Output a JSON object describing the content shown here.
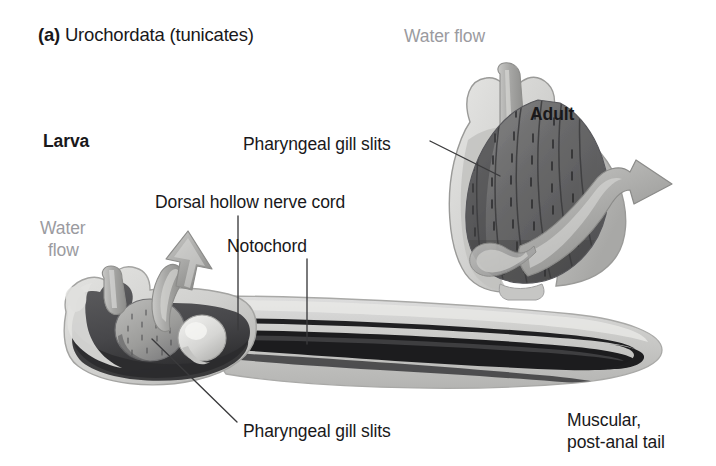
{
  "figure": {
    "panel_letter": "(a)",
    "title_text": " Urochordata (tunicates)",
    "background_color": "#ffffff"
  },
  "labels": {
    "larva": "Larva",
    "adult": "Adult",
    "water_flow_larva_line1": "Water",
    "water_flow_larva_line2": "flow",
    "water_flow_adult": "Water flow",
    "dorsal_hollow_nerve_cord": "Dorsal hollow nerve cord",
    "notochord": "Notochord",
    "pharyngeal_gill_slits_adult": "Pharyngeal gill slits",
    "pharyngeal_gill_slits_larva": "Pharyngeal gill slits",
    "muscular_line1": "Muscular,",
    "muscular_line2": "post-anal tail"
  },
  "colors": {
    "text": "#19181a",
    "text_gray": "#9b9b9f",
    "leader_line": "#3a3a3c",
    "tunic_pale": "#d8d8d6",
    "tunic_mid": "#b5b5b2",
    "tunic_dark": "#8e8e8c",
    "body_dark": "#4d4d4f",
    "body_darkest": "#333335",
    "notochord": "#1f1f21",
    "siphon_gray": "#a9a9a7",
    "gill_basket": "#6e6e70"
  },
  "diagram": {
    "organism": "Urochordata (tunicate)",
    "stages": [
      "Larva",
      "Adult"
    ],
    "larva_features": [
      "dorsal hollow nerve cord",
      "notochord",
      "pharyngeal gill slits",
      "muscular post-anal tail",
      "water flow"
    ],
    "adult_features": [
      "pharyngeal gill slits",
      "incurrent siphon",
      "excurrent siphon",
      "water flow"
    ]
  }
}
